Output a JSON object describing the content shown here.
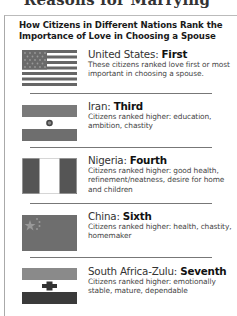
{
  "page_title": "Reasons for Marrying",
  "sidebar_box": {
    "heading_line1": "How Citizens in Different Nations Rank the",
    "heading_line2": "Importance of Love in Choosing a Spouse",
    "entries": [
      {
        "country": "United States: ",
        "rank": "First",
        "description": "These citizens ranked love first or most important in choosing a spouse.",
        "flag_icon": "us-flag-icon"
      },
      {
        "country": "Iran: ",
        "rank": "Third",
        "description": "Citizens ranked higher: education, ambition, chastity",
        "flag_icon": "iran-flag-icon"
      },
      {
        "country": "Nigeria: ",
        "rank": "Fourth",
        "description": "Citizens ranked higher: good health, refinement/neatness, desire for home and children",
        "flag_icon": "nigeria-flag-icon"
      },
      {
        "country": "China: ",
        "rank": "Sixth",
        "description": "Citizens ranked higher: health, chastity, homemaker",
        "flag_icon": "china-flag-icon"
      },
      {
        "country": "South Africa-Zulu: ",
        "rank": "Seventh",
        "description": "Citizens ranked higher: emotionally stable, mature, dependable",
        "flag_icon": "south-africa-zulu-flag-icon"
      }
    ]
  },
  "colors": {
    "flag_dark": "#555555",
    "flag_mid": "#7a7a7a",
    "flag_light": "#ffffff",
    "divider": "#777777",
    "border": "#aaaaaa"
  }
}
